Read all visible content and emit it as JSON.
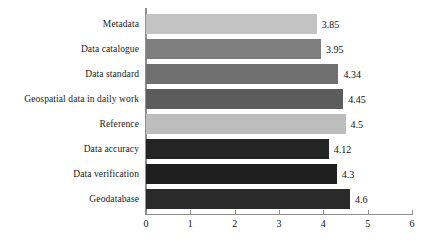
{
  "chart_data": {
    "type": "bar",
    "orientation": "horizontal",
    "title": "",
    "subtitle": "",
    "xlabel": "",
    "ylabel": "",
    "xlim": [
      0,
      6
    ],
    "xticks": [
      "0",
      "1",
      "2",
      "3",
      "4",
      "5",
      "6"
    ],
    "grid": false,
    "legend": "none",
    "categories": [
      "Metadata",
      "Data catalogue",
      "Data standard",
      "Geospatial data in daily work",
      "Reference",
      "Data accuracy",
      "Data verification",
      "Geodatabase"
    ],
    "values": [
      3.85,
      3.95,
      4.34,
      4.45,
      4.5,
      4.12,
      4.3,
      4.6
    ],
    "value_labels": [
      "3.85",
      "3.95",
      "4.34",
      "4.45",
      "4.5",
      "4.12",
      "4.3",
      "4.6"
    ],
    "bar_colors": [
      "#c3c3c3",
      "#7e7e7e",
      "#6f6f6f",
      "#5c5c5c",
      "#bdbdbd",
      "#242424",
      "#1f1f1f",
      "#2a2a2a"
    ],
    "axis_color": "#8f8f8f",
    "background": "#ffffff",
    "text_color": "#111111"
  }
}
